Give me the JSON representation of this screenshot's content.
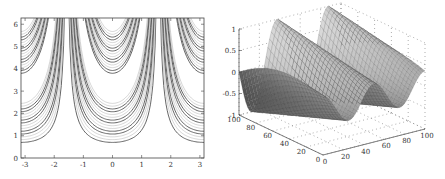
{
  "chart_data": [
    {
      "type": "contour",
      "title": "",
      "xlabel": "",
      "ylabel": "",
      "xlim": [
        -3.14,
        3.14
      ],
      "ylim": [
        0,
        6.28
      ],
      "x_ticks": [
        "-3",
        "-2",
        "-1",
        "0",
        "1",
        "2",
        "3"
      ],
      "y_ticks": [
        "0",
        "1",
        "2",
        "3",
        "4",
        "5",
        "6"
      ],
      "grid": false,
      "description": "Contour lines forming U-shaped bands: minima at x=0 and near x=±3; vertical asymptote-like columns near x=±1.6",
      "families": [
        {
          "center_x": 0,
          "bottom_levels_y": [
            0.7,
            0.95,
            1.2,
            1.45,
            1.7,
            1.95,
            2.2,
            2.5,
            3.8,
            4.0,
            4.3,
            4.6,
            4.9,
            5.2,
            5.4,
            5.7
          ]
        },
        {
          "center_x": -3.14,
          "bottom_levels_y": [
            0.7,
            0.95,
            2.2,
            2.5,
            3.8,
            4.0,
            5.4,
            5.7
          ]
        },
        {
          "center_x": 3.14,
          "bottom_levels_y": [
            0.7,
            0.95,
            2.2,
            2.5,
            3.8,
            4.0,
            5.4,
            5.7
          ]
        }
      ]
    },
    {
      "type": "surface3d",
      "title": "",
      "x_ticks": [
        "0",
        "20",
        "40",
        "60",
        "80",
        "100"
      ],
      "y_ticks": [
        "0",
        "20",
        "40",
        "60",
        "80",
        "100"
      ],
      "z_ticks": [
        "-1",
        "-0.5",
        "0",
        "0.5",
        "1"
      ],
      "xlim": [
        0,
        100
      ],
      "ylim": [
        0,
        100
      ],
      "zlim": [
        -1,
        1
      ],
      "grid": true,
      "colormap": "gray",
      "description": "Mesh surface of a cosine-like wave oscillating between -1 and 1 with two crests along the x axis"
    }
  ]
}
